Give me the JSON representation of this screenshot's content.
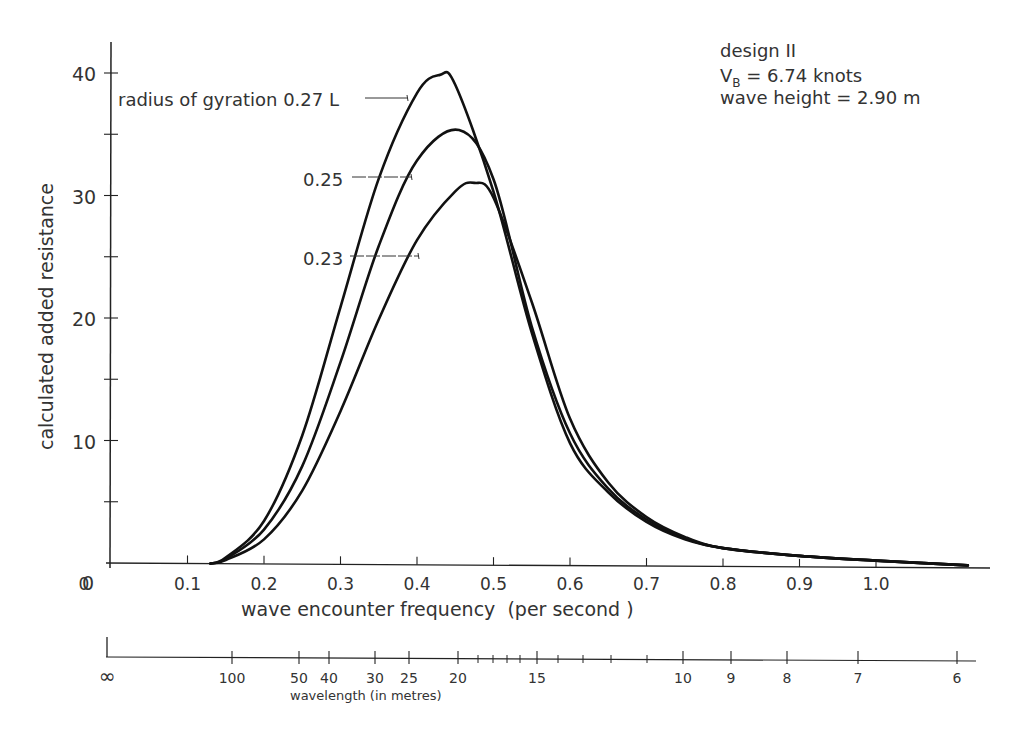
{
  "chart_data": {
    "type": "line",
    "title": "",
    "annotation": {
      "line1": "design II",
      "line2_prefix": "V",
      "line2_sub": "B",
      "line2_rest": " = 6.74 knots",
      "line3": "wave height = 2.90 m"
    },
    "xlabel": "wave encounter frequency  (per second )",
    "ylabel": "calculated added resistance",
    "xlim": [
      0,
      1.15
    ],
    "ylim": [
      0,
      40
    ],
    "grid": false,
    "x_ticks": [
      "0",
      "0.1",
      "0.2",
      "0.3",
      "0.4",
      "0.5",
      "0.6",
      "0.7",
      "0.8",
      "0.9",
      "1.0"
    ],
    "y_ticks": [
      "0",
      "10",
      "20",
      "30",
      "40"
    ],
    "secondary_axis": {
      "label": "wavelength (in metres)",
      "ticks": [
        "∞",
        "100",
        "50",
        "40",
        "30",
        "25",
        "20",
        "15",
        "10",
        "9",
        "8",
        "7",
        "6"
      ]
    },
    "series": [
      {
        "name": "radius of gyration 0.27 L",
        "label": "radius of gyration 0.27 L",
        "x": [
          0.13,
          0.15,
          0.2,
          0.25,
          0.3,
          0.35,
          0.4,
          0.43,
          0.45,
          0.5,
          0.55,
          0.6,
          0.65,
          0.7,
          0.75,
          0.8,
          0.9,
          1.0,
          1.12
        ],
        "y": [
          0.0,
          0.5,
          3.5,
          10.5,
          21.0,
          31.5,
          38.5,
          40.0,
          39.2,
          30.5,
          19.0,
          10.0,
          6.0,
          3.6,
          2.2,
          1.5,
          0.9,
          0.55,
          0.2
        ]
      },
      {
        "name": "0.25",
        "label": "0.25",
        "x": [
          0.13,
          0.15,
          0.2,
          0.25,
          0.3,
          0.35,
          0.4,
          0.455,
          0.5,
          0.55,
          0.6,
          0.65,
          0.7,
          0.75,
          0.8,
          0.9,
          1.0,
          1.12
        ],
        "y": [
          0.0,
          0.4,
          2.8,
          8.0,
          16.5,
          26.0,
          33.0,
          35.5,
          31.5,
          19.5,
          10.8,
          6.3,
          3.8,
          2.3,
          1.5,
          0.9,
          0.55,
          0.2
        ]
      },
      {
        "name": "0.23",
        "label": "0.23",
        "x": [
          0.13,
          0.15,
          0.2,
          0.25,
          0.3,
          0.35,
          0.4,
          0.45,
          0.475,
          0.5,
          0.55,
          0.6,
          0.65,
          0.7,
          0.75,
          0.8,
          0.9,
          1.0,
          1.12
        ],
        "y": [
          0.0,
          0.3,
          2.0,
          6.0,
          12.5,
          20.0,
          26.5,
          30.5,
          31.2,
          30.0,
          21.5,
          12.0,
          6.8,
          4.0,
          2.4,
          1.5,
          0.9,
          0.55,
          0.2
        ]
      }
    ]
  }
}
